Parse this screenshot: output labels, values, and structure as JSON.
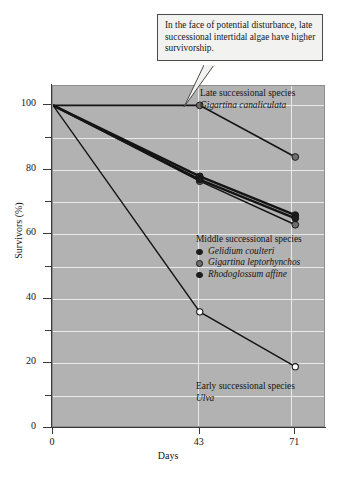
{
  "callout": {
    "text": "In the face of potential disturbance, late successional intertidal algae have higher survivorship."
  },
  "annotations": {
    "late": {
      "heading": "Late successional species",
      "species": "Gigartina canaliculata"
    },
    "middle": {
      "heading": "Middle successional species",
      "species": [
        {
          "name": "Gelidium coulteri",
          "marker": "filled-dark-circle",
          "color": "#1c1c1c"
        },
        {
          "name": "Gigartina leptorhynchos",
          "marker": "filled-gray-circle",
          "color": "#6d6d6d"
        },
        {
          "name": "Rhodoglossum affine",
          "marker": "filled-dark-circle",
          "color": "#1c1c1c"
        }
      ]
    },
    "early": {
      "heading": "Early successional species",
      "species": "Ulva"
    }
  },
  "chart_data": {
    "type": "line",
    "title": "",
    "xlabel": "Days",
    "ylabel": "Survivors (%)",
    "x": [
      0,
      43,
      71
    ],
    "xtick_labels": [
      "0",
      "43",
      "71"
    ],
    "xlim": [
      0,
      80
    ],
    "ylim": [
      0,
      106
    ],
    "ytick_labels": [
      "0",
      "20",
      "40",
      "60",
      "80",
      "100"
    ],
    "ytick_values": [
      0,
      20,
      40,
      60,
      80,
      100
    ],
    "yminor_values": [
      10,
      30,
      50,
      70,
      90
    ],
    "grid": "horizontal-and-vertical-white",
    "legend": "in-plot-annotations",
    "plot_background": "#b2b2b2",
    "series": [
      {
        "name": "Gigartina canaliculata",
        "group": "late successional",
        "values": [
          100,
          100,
          84
        ],
        "marker": "filled-gray-circle",
        "marker_color": "#6d6d6d",
        "line_color": "#141414",
        "line_width": 1.6
      },
      {
        "name": "Gelidium coulteri",
        "group": "middle successional",
        "values": [
          100,
          78,
          66
        ],
        "marker": "filled-dark-circle",
        "marker_color": "#1c1c1c",
        "line_color": "#141414",
        "line_width": 2.4
      },
      {
        "name": "Gigartina leptorhynchos",
        "group": "middle successional",
        "values": [
          100,
          76.5,
          63
        ],
        "marker": "filled-gray-circle",
        "marker_color": "#6d6d6d",
        "line_color": "#141414",
        "line_width": 1.4
      },
      {
        "name": "Rhodoglossum affine",
        "group": "middle successional",
        "values": [
          100,
          77,
          65
        ],
        "marker": "filled-dark-circle",
        "marker_color": "#1c1c1c",
        "line_color": "#141414",
        "line_width": 2.4
      },
      {
        "name": "Ulva",
        "group": "early successional",
        "values": [
          100,
          36,
          19
        ],
        "marker": "open-circle",
        "marker_color": "#ffffff",
        "line_color": "#141414",
        "line_width": 1.4
      }
    ]
  }
}
